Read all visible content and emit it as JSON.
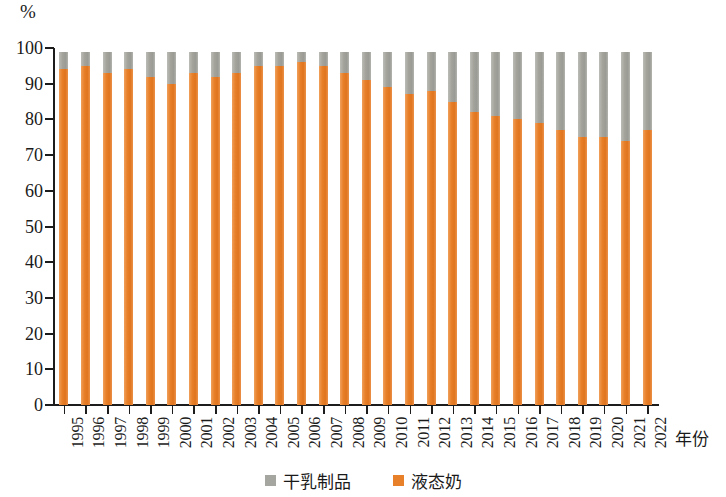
{
  "chart_data": {
    "type": "bar",
    "stacked": true,
    "title": "",
    "subtitle": "",
    "xlabel": "年份",
    "ylabel": "",
    "y_unit": "%",
    "ylim": [
      0,
      100
    ],
    "ytick_labels": [
      "0",
      "10",
      "20",
      "30",
      "40",
      "50",
      "60",
      "70",
      "80",
      "90",
      "100"
    ],
    "ytick_values": [
      0,
      10,
      20,
      30,
      40,
      50,
      60,
      70,
      80,
      90,
      100
    ],
    "grid": false,
    "legend_position": "bottom",
    "categories": [
      "1995",
      "1996",
      "1997",
      "1998",
      "1999",
      "2000",
      "2001",
      "2002",
      "2003",
      "2004",
      "2005",
      "2006",
      "2007",
      "2008",
      "2009",
      "2010",
      "2011",
      "2012",
      "2013",
      "2014",
      "2015",
      "2016",
      "2017",
      "2018",
      "2019",
      "2020",
      "2021",
      "2022"
    ],
    "series": [
      {
        "name": "液态奶",
        "color": "#e8802a",
        "values": [
          94,
          95,
          93,
          94,
          92,
          90,
          93,
          92,
          93,
          95,
          95,
          96,
          95,
          93,
          91,
          89,
          87,
          88,
          85,
          82,
          81,
          80,
          79,
          77,
          75,
          75,
          74,
          77
        ]
      },
      {
        "name": "干乳制品",
        "color": "#a6a6a0",
        "values": [
          5,
          4,
          6,
          5,
          7,
          9,
          6,
          7,
          6,
          4,
          4,
          3,
          4,
          6,
          8,
          10,
          12,
          11,
          14,
          17,
          18,
          19,
          20,
          22,
          24,
          24,
          25,
          22
        ]
      }
    ],
    "bar_totals": [
      99,
      99,
      99,
      99,
      99,
      99,
      99,
      99,
      99,
      99,
      99,
      99,
      99,
      99,
      99,
      99,
      99,
      99,
      99,
      99,
      99,
      99,
      99,
      99,
      99,
      99,
      99,
      99
    ]
  },
  "legend": {
    "items": [
      {
        "label": "干乳制品",
        "color": "#a6a6a0"
      },
      {
        "label": "液态奶",
        "color": "#e8802a"
      }
    ]
  },
  "axis": {
    "y_unit_label": "%",
    "x_title": "年份"
  }
}
